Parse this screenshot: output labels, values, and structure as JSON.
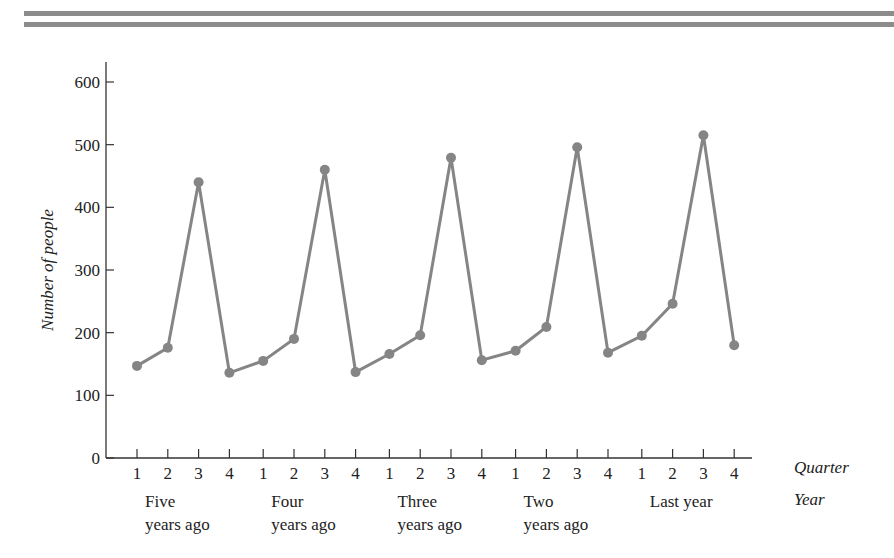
{
  "header": {
    "rule_color": "#8c8c8c"
  },
  "colors": {
    "series": "#858585",
    "axis": "#333333"
  },
  "chart_data": {
    "type": "line",
    "title": "",
    "xlabel": "Quarter / Year",
    "ylabel": "Number of people",
    "ylim": [
      0,
      600
    ],
    "yticks": [
      0,
      100,
      200,
      300,
      400,
      500,
      600
    ],
    "grid": false,
    "legend": null,
    "x_axis_row_labels": {
      "quarter": "Quarter",
      "year": "Year"
    },
    "years": [
      {
        "label_line1": "Five",
        "label_line2": "years ago"
      },
      {
        "label_line1": "Four",
        "label_line2": "years ago"
      },
      {
        "label_line1": "Three",
        "label_line2": "years ago"
      },
      {
        "label_line1": "Two",
        "label_line2": "years ago"
      },
      {
        "label_line1": "Last year",
        "label_line2": ""
      }
    ],
    "categories": [
      "1",
      "2",
      "3",
      "4",
      "1",
      "2",
      "3",
      "4",
      "1",
      "2",
      "3",
      "4",
      "1",
      "2",
      "3",
      "4",
      "1",
      "2",
      "3",
      "4"
    ],
    "series": [
      {
        "name": "Number of people",
        "values": [
          147,
          176,
          440,
          136,
          155,
          190,
          460,
          137,
          166,
          196,
          479,
          156,
          171,
          209,
          496,
          168,
          195,
          246,
          515,
          180
        ]
      }
    ]
  }
}
